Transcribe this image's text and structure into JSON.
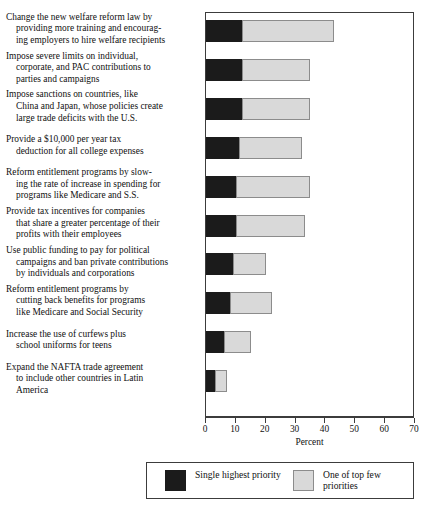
{
  "chart_data": {
    "type": "bar",
    "orientation": "horizontal",
    "stacked": true,
    "title": "",
    "xlabel": "Percent",
    "ylabel": "",
    "xlim": [
      0,
      70
    ],
    "xticks": [
      0,
      10,
      20,
      30,
      40,
      50,
      60,
      70
    ],
    "xtick_labels": [
      "0",
      "10",
      "20",
      "30",
      "40",
      "50",
      "60",
      "70"
    ],
    "grid": false,
    "legend_position": "bottom",
    "categories": [
      "Change the new welfare reform law by providing more training and encouraging employers to hire welfare recipients",
      "Impose severe limits on individual, corporate, and PAC contributions to parties and campaigns",
      "Impose sanctions on countries, like China and Japan, whose policies create large trade deficits with the U.S.",
      "Provide a $10,000 per year tax deduction for all college expenses",
      "Reform entitlement programs by slowing the rate of increase in spending for programs like Medicare and S.S.",
      "Provide tax incentives for companies that share a greater percentage of their profits with their employees",
      "Use public funding to pay for political campaigns and ban private contributions by individuals and corporations",
      "Reform entitlement programs by cutting back benefits for programs like Medicare and Social Security",
      "Increase the use of curfews plus school uniforms for teens",
      "Expand the NAFTA trade agreement to include other countries in Latin America"
    ],
    "category_label_lines": [
      "Change the new welfare reform law by\nproviding more training and encourag-\ning employers to hire welfare recipients",
      "Impose severe limits on individual,\ncorporate, and PAC contributions to\nparties and campaigns",
      "Impose sanctions on countries, like\nChina and Japan, whose policies create\nlarge trade deficits with the U.S.",
      "Provide a $10,000 per year tax\ndeduction for all college expenses",
      "Reform entitlement programs by slow-\ning the rate of increase in spending for\nprograms like Medicare and S.S.",
      "Provide tax incentives for companies\nthat share a greater percentage of their\nprofits with their employees",
      "Use public funding to pay for political\ncampaigns and ban private contributions\nby individuals and corporations",
      "Reform entitlement programs by\ncutting back benefits for programs\nlike Medicare and Social Security",
      "Increase the use of curfews plus\nschool uniforms for teens",
      "Expand the NAFTA trade agreement\nto include other countries in Latin\nAmerica"
    ],
    "series": [
      {
        "name": "Single highest priority",
        "color": "#1b1b1b",
        "values": [
          12,
          12,
          12,
          11,
          10,
          10,
          9,
          8,
          6,
          3
        ]
      },
      {
        "name": "One of top few priorities",
        "color": "#d9d9d9",
        "values": [
          31,
          23,
          23,
          21,
          25,
          23,
          11,
          14,
          9,
          4
        ]
      }
    ],
    "totals": [
      43,
      35,
      35,
      32,
      35,
      33,
      20,
      22,
      15,
      7
    ]
  },
  "legend": {
    "items": [
      {
        "label": "Single highest priority",
        "swatch": "black-square-swatch"
      },
      {
        "label": "One of top few\npriorities",
        "swatch": "gray-square-swatch"
      }
    ]
  },
  "axis": {
    "x_title": "Percent"
  }
}
